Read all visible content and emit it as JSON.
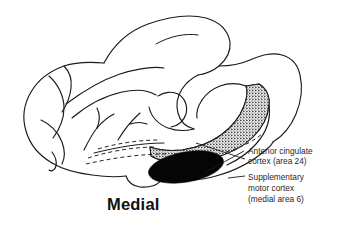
{
  "figure": {
    "kind": "anatomical-line-drawing",
    "view_title": "Medial",
    "background_color": "#ffffff",
    "line_color": "#1a1a1a"
  },
  "annotations": [
    {
      "id": "anterior-cingulate",
      "line1": "Anterior cingulate",
      "line2": "cortex (area 24)",
      "fill_style": "stippled",
      "fill_color": "#1a1a1a"
    },
    {
      "id": "supplementary-motor",
      "line1": "Supplementary",
      "line2": "motor cortex",
      "line3": "(medial area 6)",
      "fill_style": "solid-black",
      "fill_color": "#050505"
    }
  ],
  "view_label": {
    "text": "Medial"
  }
}
